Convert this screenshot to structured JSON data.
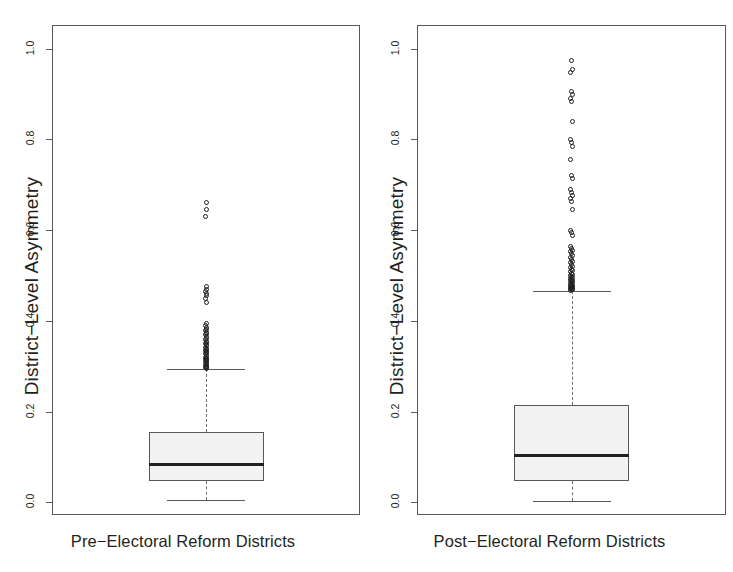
{
  "figure": {
    "type": "boxplot-pair",
    "background": "#ffffff",
    "ink_color": "#231f20",
    "box_fill": "#f2f2f2",
    "axis_color": "#58595b"
  },
  "panels": [
    {
      "id": "pre-reform",
      "ylabel": "District−Level Asymmetry",
      "xlabel": "Pre−Electoral Reform Districts",
      "yticks": [
        "0.0",
        "0.2",
        "0.4",
        "0.6",
        "0.8",
        "1.0"
      ]
    },
    {
      "id": "post-reform",
      "ylabel": "District−Level Asymmetry",
      "xlabel": "Post−Electoral Reform Districts",
      "yticks": [
        "0.0",
        "0.2",
        "0.4",
        "0.6",
        "0.8",
        "1.0"
      ]
    }
  ],
  "chart_data": {
    "type": "box",
    "title": "",
    "xlabel": "",
    "ylabel": "District−Level Asymmetry",
    "ylim": [
      -0.03,
      1.05
    ],
    "yticks": [
      0.0,
      0.2,
      0.4,
      0.6,
      0.8,
      1.0
    ],
    "ytick_labels": [
      "0.0",
      "0.2",
      "0.4",
      "0.6",
      "0.8",
      "1.0"
    ],
    "grid": false,
    "legend": "none",
    "panel_layout": "1x2",
    "categories": [
      "Pre−Electoral Reform Districts",
      "Post−Electoral Reform Districts"
    ],
    "series": [
      {
        "name": "Pre−Electoral Reform Districts",
        "whisker_low": 0.005,
        "q1": 0.048,
        "median": 0.085,
        "q3": 0.155,
        "whisker_high": 0.295,
        "outliers": [
          0.66,
          0.645,
          0.63,
          0.475,
          0.47,
          0.465,
          0.46,
          0.455,
          0.45,
          0.44,
          0.395,
          0.39,
          0.385,
          0.382,
          0.378,
          0.375,
          0.372,
          0.37,
          0.365,
          0.362,
          0.358,
          0.355,
          0.352,
          0.35,
          0.347,
          0.345,
          0.342,
          0.34,
          0.338,
          0.335,
          0.332,
          0.33,
          0.328,
          0.325,
          0.322,
          0.32,
          0.318,
          0.316,
          0.314,
          0.312,
          0.31,
          0.308,
          0.306,
          0.304,
          0.302,
          0.3,
          0.299,
          0.298,
          0.297,
          0.296
        ]
      },
      {
        "name": "Post−Electoral Reform Districts",
        "whisker_low": 0.003,
        "q1": 0.048,
        "median": 0.105,
        "q3": 0.215,
        "whisker_high": 0.465,
        "outliers": [
          0.975,
          0.955,
          0.948,
          0.905,
          0.898,
          0.89,
          0.883,
          0.84,
          0.8,
          0.793,
          0.785,
          0.755,
          0.72,
          0.713,
          0.69,
          0.683,
          0.676,
          0.67,
          0.663,
          0.645,
          0.6,
          0.594,
          0.588,
          0.565,
          0.56,
          0.556,
          0.552,
          0.548,
          0.544,
          0.54,
          0.536,
          0.532,
          0.528,
          0.524,
          0.52,
          0.517,
          0.514,
          0.511,
          0.508,
          0.505,
          0.502,
          0.5,
          0.498,
          0.496,
          0.494,
          0.492,
          0.49,
          0.488,
          0.486,
          0.484,
          0.482,
          0.48,
          0.478,
          0.477,
          0.476,
          0.475,
          0.474,
          0.473,
          0.472,
          0.471,
          0.47,
          0.469,
          0.468
        ]
      }
    ]
  }
}
